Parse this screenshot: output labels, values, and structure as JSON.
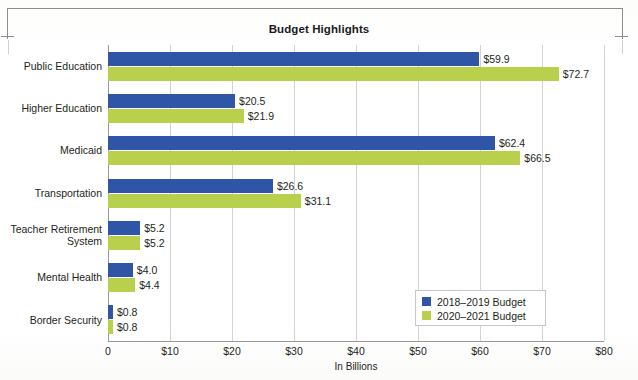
{
  "chart_data": {
    "type": "bar",
    "orientation": "horizontal",
    "title": "Budget Highlights",
    "xlabel": "In Billions",
    "ylabel": "",
    "xlim": [
      0,
      80
    ],
    "xticks": [
      "0",
      "$10",
      "$20",
      "$30",
      "$40",
      "$50",
      "$60",
      "$70",
      "$80"
    ],
    "xtick_values": [
      0,
      10,
      20,
      30,
      40,
      50,
      60,
      70,
      80
    ],
    "grid": true,
    "legend_position": "lower right",
    "categories": [
      "Public Education",
      "Higher Education",
      "Medicaid",
      "Transportation",
      "Teacher Retirement\nSystem",
      "Mental Health",
      "Border Security"
    ],
    "series": [
      {
        "name": "2018–2019 Budget",
        "color": "#2f56a6",
        "values": [
          59.9,
          20.5,
          62.4,
          26.6,
          5.2,
          4.0,
          0.8
        ],
        "labels": [
          "$59.9",
          "$20.5",
          "$62.4",
          "$26.6",
          "$5.2",
          "$4.0",
          "$0.8"
        ]
      },
      {
        "name": "2020–2021 Budget",
        "color": "#b8d04c",
        "values": [
          72.7,
          21.9,
          66.5,
          31.1,
          5.2,
          4.4,
          0.8
        ],
        "labels": [
          "$72.7",
          "$21.9",
          "$66.5",
          "$31.1",
          "$5.2",
          "$4.4",
          "$0.8"
        ]
      }
    ]
  },
  "colors": {
    "series_a": "#2f56a6",
    "series_b": "#b8d04c",
    "gridline": "#d3d3d3",
    "axis": "#9a9a9a",
    "text": "#231f20",
    "page_background": "#ffffff"
  }
}
